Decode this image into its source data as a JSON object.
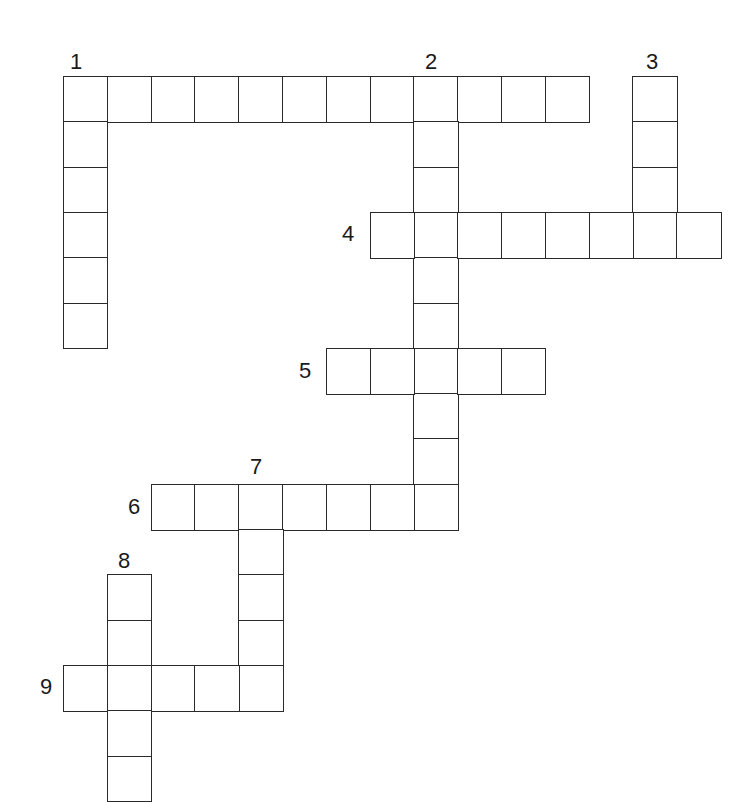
{
  "puzzle": {
    "type": "crossword",
    "origin": {
      "x": 63,
      "y": 76
    },
    "cell_width": 43.8,
    "cell_height": 45.3,
    "line_color": "#2a2a2a",
    "number_color": "#1a1a1a"
  },
  "entries": [
    {
      "number": "1",
      "direction": "across",
      "row": 0,
      "col": 0,
      "length": 12,
      "label_pos": {
        "x": 70,
        "y": 51
      }
    },
    {
      "number": "1",
      "direction": "down",
      "row": 0,
      "col": 0,
      "length": 6,
      "label_pos": null
    },
    {
      "number": "2",
      "direction": "down",
      "row": 0,
      "col": 8,
      "length": 10,
      "label_pos": {
        "x": 425,
        "y": 51
      }
    },
    {
      "number": "3",
      "direction": "down",
      "row": 0,
      "col": 13,
      "length": 4,
      "label_pos": {
        "x": 646,
        "y": 51
      }
    },
    {
      "number": "4",
      "direction": "across",
      "row": 3,
      "col": 7,
      "length": 8,
      "label_pos": {
        "x": 342,
        "y": 223
      }
    },
    {
      "number": "5",
      "direction": "across",
      "row": 6,
      "col": 6,
      "length": 5,
      "label_pos": {
        "x": 299,
        "y": 360
      }
    },
    {
      "number": "6",
      "direction": "across",
      "row": 9,
      "col": 2,
      "length": 7,
      "label_pos": {
        "x": 128,
        "y": 496
      }
    },
    {
      "number": "7",
      "direction": "down",
      "row": 9,
      "col": 4,
      "length": 5,
      "label_pos": {
        "x": 250,
        "y": 456
      }
    },
    {
      "number": "8",
      "direction": "down",
      "row": 11,
      "col": 1,
      "length": 5,
      "label_pos": {
        "x": 118,
        "y": 550
      }
    },
    {
      "number": "9",
      "direction": "across",
      "row": 13,
      "col": 0,
      "length": 5,
      "label_pos": {
        "x": 40,
        "y": 676
      }
    }
  ]
}
